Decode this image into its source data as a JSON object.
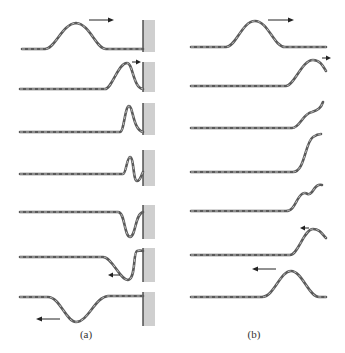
{
  "figure": {
    "panels": [
      {
        "id": "a",
        "caption": "(a)",
        "boundary": "fixed-end-wall",
        "frames": [
          {
            "step": 1,
            "pulse": "upright pulse traveling toward wall",
            "arrow": "right"
          },
          {
            "step": 2,
            "pulse": "pulse reaching wall",
            "arrow": "right"
          },
          {
            "step": 3,
            "pulse": "pulse compressed at wall",
            "arrow": "none"
          },
          {
            "step": 4,
            "pulse": "superposition at wall",
            "arrow": "none"
          },
          {
            "step": 5,
            "pulse": "inverted pulse forming",
            "arrow": "none"
          },
          {
            "step": 6,
            "pulse": "inverted pulse leaving wall",
            "arrow": "left"
          },
          {
            "step": 7,
            "pulse": "inverted pulse traveling away",
            "arrow": "left"
          }
        ]
      },
      {
        "id": "b",
        "caption": "(b)",
        "boundary": "free-end",
        "frames": [
          {
            "step": 1,
            "pulse": "upright pulse traveling toward free end",
            "arrow": "right"
          },
          {
            "step": 2,
            "pulse": "pulse reaching free end",
            "arrow": "right"
          },
          {
            "step": 3,
            "pulse": "free end rising",
            "arrow": "none"
          },
          {
            "step": 4,
            "pulse": "free end at maximum",
            "arrow": "none"
          },
          {
            "step": 5,
            "pulse": "free end returning",
            "arrow": "none"
          },
          {
            "step": 6,
            "pulse": "upright pulse leaving end",
            "arrow": "left"
          },
          {
            "step": 7,
            "pulse": "upright pulse traveling away",
            "arrow": "left"
          }
        ]
      }
    ]
  }
}
